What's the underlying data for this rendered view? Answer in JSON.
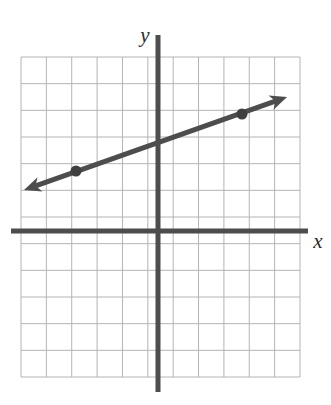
{
  "figure": {
    "title": "",
    "background_color": "#ffffff",
    "width": 331,
    "height": 405
  },
  "axes": {
    "x_axis": {
      "label": "x",
      "color": "#4d4d4d",
      "thickness": 5,
      "pixel_y": 231,
      "pixel_x_start": 11,
      "pixel_x_end": 308
    },
    "y_axis": {
      "label": "y",
      "color": "#4d4d4d",
      "thickness": 5,
      "pixel_x": 158,
      "pixel_y_start": 35,
      "pixel_y_end": 392
    },
    "labels": {
      "x_label": "x",
      "y_label": "y"
    }
  },
  "grid": {
    "visible": true,
    "color": "#b4b4b4",
    "line_width": 1,
    "cell_size_px": 26.7,
    "columns": 11,
    "rows": 12,
    "left_px": 21,
    "top_px": 57,
    "right_px": 300,
    "bottom_px": 377,
    "x_range": [
      -5,
      6
    ],
    "y_range": [
      -6,
      6
    ]
  },
  "chart_data": {
    "type": "line",
    "title": "",
    "xlabel": "x",
    "ylabel": "y",
    "grid": true,
    "legend": "none",
    "xlim": [
      -5,
      6
    ],
    "ylim": [
      -6,
      6
    ],
    "x_tick_labels": [],
    "y_tick_labels": [],
    "series": [
      {
        "name": "line",
        "color": "#4d4d4d",
        "line_width": 5,
        "arrows": "both",
        "slope": 0.3333,
        "y_intercept": 3,
        "equation": "y = (1/3)x + 3",
        "points": [
          {
            "label": "point-left",
            "x": -3,
            "y": 2,
            "pixel_x": 76,
            "pixel_y": 171,
            "marker": "filled-circle",
            "marker_size": 11
          },
          {
            "label": "point-right",
            "x": 3,
            "y": 4,
            "pixel_x": 242,
            "pixel_y": 114,
            "marker": "filled-circle",
            "marker_size": 11
          }
        ],
        "arrow_tips": [
          {
            "label": "arrow-left",
            "pixel_x": 24,
            "pixel_y": 190
          },
          {
            "label": "arrow-right",
            "pixel_x": 287,
            "pixel_y": 97
          }
        ]
      }
    ]
  },
  "colors": {
    "grid_line": "#b4b4b4",
    "axis": "#4d4d4d",
    "data_line": "#4d4d4d",
    "marker": "#3f3f3f",
    "label_text": "#2b2b2b",
    "background": "#ffffff"
  }
}
